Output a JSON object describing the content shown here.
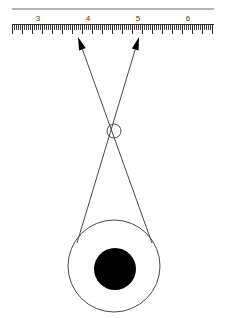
{
  "figure": {
    "background_color": "#ffffff",
    "line_color": "#4a4a4a",
    "ink_color": "#000000",
    "width": 226,
    "height": 318
  },
  "ruler": {
    "name": "measuring-scale",
    "baseline_y": 24,
    "top_rule_y": 9,
    "x_start": 12,
    "x_end": 214,
    "pixels_per_unit": 50,
    "unit_origin_x": 38,
    "origin_value": 3,
    "labels": [
      {
        "value": "3",
        "x": 38
      },
      {
        "value": "4",
        "x": 88
      },
      {
        "value": "5",
        "x": 138
      },
      {
        "value": "6",
        "x": 188
      }
    ],
    "ticks": {
      "minor_count": 101,
      "minor_spacing": 2,
      "minor_length": 6,
      "major_every": 5,
      "major_length": 10,
      "tick_color": "#2f2f2f"
    }
  },
  "rays": {
    "name": "light-rays",
    "crossing_point": {
      "x": 114,
      "y": 131,
      "radius": 7
    },
    "left_ray": {
      "label": "left-ray",
      "tip": {
        "x": 78,
        "y": 37
      },
      "tail": {
        "x": 152,
        "y": 243
      },
      "arrow_at": "tip"
    },
    "right_ray": {
      "label": "right-ray",
      "tip": {
        "x": 139,
        "y": 37
      },
      "tail": {
        "x": 77,
        "y": 243
      },
      "arrow_at": "tip"
    },
    "arrow_size": {
      "length": 13,
      "width": 7
    }
  },
  "eye": {
    "name": "eye-globe",
    "outer_circle": {
      "cx": 114,
      "cy": 266,
      "r": 46,
      "fill": "none",
      "stroke": "#4a4a4a"
    },
    "pupil": {
      "cx": 115,
      "cy": 269,
      "r": 21,
      "fill": "#000000"
    }
  }
}
